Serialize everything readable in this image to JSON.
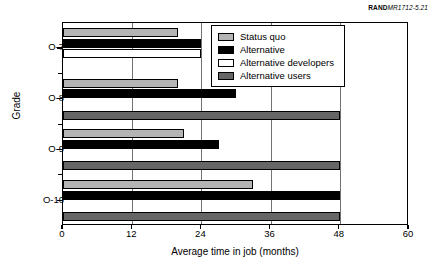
{
  "credit": {
    "brand": "RAND",
    "reference": "MR1712-5.21"
  },
  "chart_data": {
    "type": "bar",
    "orientation": "horizontal",
    "title": "",
    "xlabel": "Average time in job (months)",
    "ylabel": "Grade",
    "categories": [
      "O-7",
      "O-8",
      "O-9",
      "O-10"
    ],
    "xlim": [
      0,
      60
    ],
    "xticks": [
      0,
      12,
      24,
      36,
      48,
      60
    ],
    "grid": false,
    "legend_position": "top-right",
    "series": [
      {
        "name": "Status quo",
        "color": "#b4b4b4",
        "values": [
          20,
          20,
          21,
          33
        ]
      },
      {
        "name": "Alternative",
        "color": "#000000",
        "values": [
          24,
          30,
          27,
          48
        ]
      },
      {
        "name": "Alternative developers",
        "color": "#ffffff",
        "values": [
          24,
          0,
          0,
          0
        ]
      },
      {
        "name": "Alternative users",
        "color": "#666666",
        "values": [
          0,
          48,
          48,
          48
        ]
      }
    ]
  }
}
